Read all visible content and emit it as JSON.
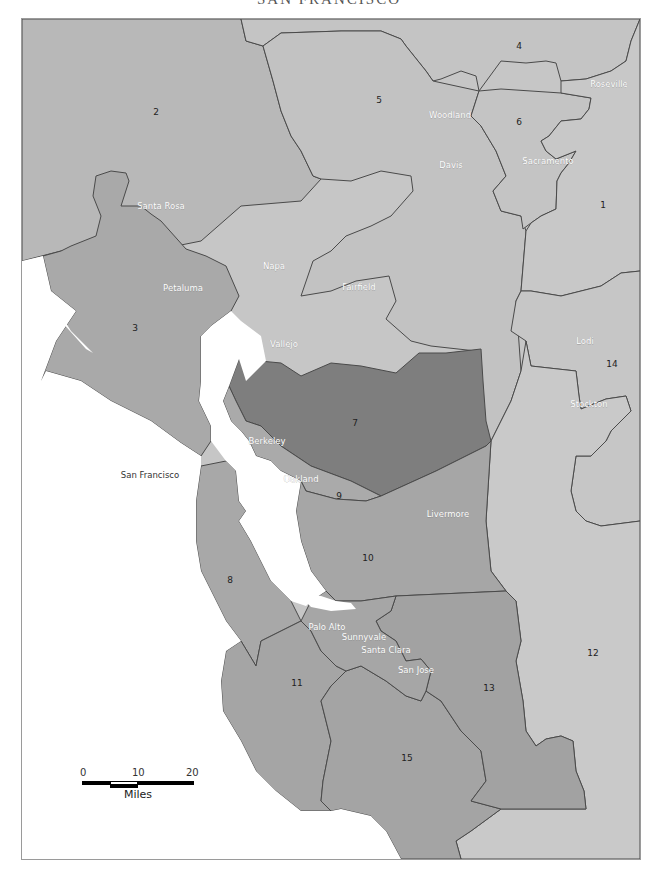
{
  "title": "SAN FRANCISCO",
  "colors": {
    "water": "#ffffff",
    "light_district": "#c8c8c8",
    "medium_district": "#b2b2b2",
    "mid_dark_district": "#a4a4a4",
    "dark_district": "#7e7e7e",
    "border": "#4a4a4a"
  },
  "districts": [
    {
      "id": "1",
      "label": "1"
    },
    {
      "id": "2",
      "label": "2"
    },
    {
      "id": "3",
      "label": "3"
    },
    {
      "id": "4",
      "label": "4"
    },
    {
      "id": "5",
      "label": "5"
    },
    {
      "id": "6",
      "label": "6"
    },
    {
      "id": "7",
      "label": "7"
    },
    {
      "id": "8",
      "label": "8"
    },
    {
      "id": "9",
      "label": "9"
    },
    {
      "id": "10",
      "label": "10"
    },
    {
      "id": "11",
      "label": "11"
    },
    {
      "id": "12",
      "label": "12"
    },
    {
      "id": "13",
      "label": "13"
    },
    {
      "id": "14",
      "label": "14"
    },
    {
      "id": "15",
      "label": "15"
    }
  ],
  "cities": [
    {
      "name": "Roseville"
    },
    {
      "name": "Woodland"
    },
    {
      "name": "Sacramento"
    },
    {
      "name": "Davis"
    },
    {
      "name": "Santa Rosa"
    },
    {
      "name": "Napa"
    },
    {
      "name": "Fairfield"
    },
    {
      "name": "Petaluma"
    },
    {
      "name": "Vallejo"
    },
    {
      "name": "Lodi"
    },
    {
      "name": "Stockton"
    },
    {
      "name": "Berkeley"
    },
    {
      "name": "San Francisco"
    },
    {
      "name": "Oakland"
    },
    {
      "name": "Livermore"
    },
    {
      "name": "Palo Alto"
    },
    {
      "name": "Sunnyvale"
    },
    {
      "name": "Santa Clara"
    },
    {
      "name": "San Jose"
    }
  ],
  "scale_bar": {
    "ticks": [
      "0",
      "10",
      "20"
    ],
    "unit": "Miles"
  }
}
